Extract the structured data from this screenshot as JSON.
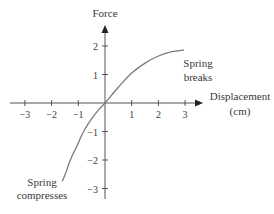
{
  "chart_data": {
    "type": "line",
    "title": "",
    "xlabel": "Displacement (cm)",
    "xlabel_lines": [
      "Displacement",
      "(cm)"
    ],
    "ylabel": "Force",
    "xlim": [
      -3,
      3
    ],
    "ylim": [
      -3,
      2
    ],
    "grid": false,
    "legend": null,
    "x_ticks": [
      -3,
      -2,
      -1,
      1,
      2,
      3
    ],
    "x_tick_labels": [
      "−3",
      "−2",
      "−1",
      "1",
      "2",
      "3"
    ],
    "y_ticks": [
      2,
      1,
      -1,
      -2,
      -3
    ],
    "y_tick_labels": [
      "2",
      "1",
      "−1",
      "−2",
      "−3"
    ],
    "series": [
      {
        "name": "Spring force vs displacement",
        "x": [
          -1.6,
          -1.45,
          -1.3,
          -1.05,
          -0.8,
          -0.5,
          -0.25,
          0,
          0.5,
          1.0,
          1.5,
          2.0,
          2.5,
          2.95
        ],
        "y": [
          -2.75,
          -2.4,
          -2.0,
          -1.5,
          -1.0,
          -0.55,
          -0.25,
          0,
          0.55,
          1.05,
          1.4,
          1.65,
          1.8,
          1.86
        ],
        "color": "#7a7a7a"
      }
    ],
    "annotations": [
      {
        "text_lines": [
          "Spring",
          "breaks"
        ],
        "x": 3.0,
        "y": 1.5
      },
      {
        "text_lines": [
          "Spring",
          "compresses"
        ],
        "x": -2.0,
        "y": -3.1
      }
    ]
  },
  "labels": {
    "y_axis_title": "Force",
    "x_axis_title_line1": "Displacement",
    "x_axis_title_line2": "(cm)",
    "annotation_top_line1": "Spring",
    "annotation_top_line2": "breaks",
    "annotation_bottom_line1": "Spring",
    "annotation_bottom_line2": "compresses"
  },
  "colors": {
    "axis": "#555555",
    "curve": "#7a7a7a",
    "text": "#3a3a3a"
  }
}
